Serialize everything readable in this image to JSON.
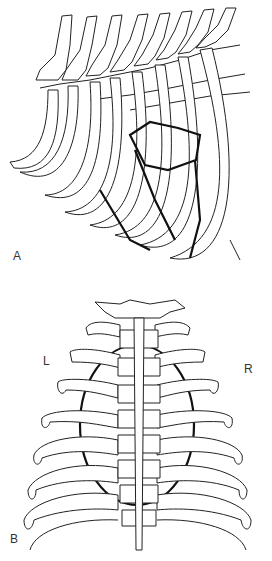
{
  "figure": {
    "panels": [
      {
        "id": "A",
        "label": "A",
        "view": "lateral thorax / rib cage"
      },
      {
        "id": "B",
        "label": "B",
        "view": "dorsal thoracic spine and ribs",
        "side_labels": {
          "left": "L",
          "right": "R"
        }
      }
    ]
  }
}
